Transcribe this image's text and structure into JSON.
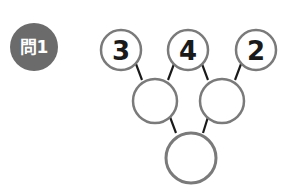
{
  "problem": {
    "label": "問1",
    "badge_color": "#6b6b6b",
    "top_numbers": [
      "3",
      "4",
      "2"
    ],
    "middle_blanks": [
      "",
      ""
    ],
    "bottom_blank": "",
    "circle_stroke_color": "#7a7a7a",
    "connector_color": "#1a1a1a"
  }
}
